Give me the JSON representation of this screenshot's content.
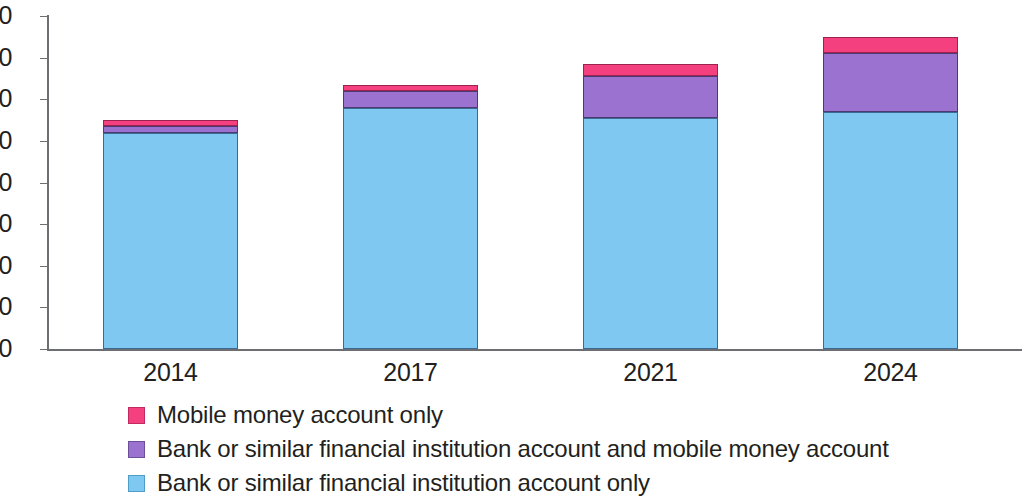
{
  "chart_data": {
    "type": "bar",
    "stacked": true,
    "title": "",
    "subtitle": "",
    "xlabel": "",
    "ylabel": "",
    "categories": [
      "2014",
      "2017",
      "2021",
      "2024"
    ],
    "ylim": [
      0,
      80
    ],
    "yticks": [
      0,
      10,
      20,
      30,
      40,
      50,
      60,
      70,
      80
    ],
    "ytick_labels": [
      "0",
      "10",
      "20",
      "30",
      "40",
      "50",
      "60",
      "70",
      "80"
    ],
    "grid": false,
    "legend_position": "bottom-left",
    "series": [
      {
        "name": "Bank or similar financial institution account only",
        "color": "#7ec8f2",
        "values": [
          52,
          58,
          55.5,
          57
        ]
      },
      {
        "name": "Bank or similar financial institution account and mobile money account",
        "color": "#9b72cf",
        "values": [
          1.5,
          4,
          10,
          14
        ]
      },
      {
        "name": "Mobile money account only",
        "color": "#f5407f",
        "values": [
          1.5,
          1.5,
          3,
          4
        ]
      }
    ],
    "totals": [
      55,
      63.5,
      68.5,
      75
    ]
  },
  "axis": {
    "y_ticks": [
      {
        "label": "80",
        "value": 80
      },
      {
        "label": "70",
        "value": 70
      },
      {
        "label": "60",
        "value": 60
      },
      {
        "label": "50",
        "value": 50
      },
      {
        "label": "40",
        "value": 40
      },
      {
        "label": "30",
        "value": 30
      },
      {
        "label": "20",
        "value": 20
      },
      {
        "label": "10",
        "value": 10
      },
      {
        "label": "0",
        "value": 0
      }
    ],
    "x_labels": [
      "2014",
      "2017",
      "2021",
      "2024"
    ]
  },
  "legend": {
    "items": [
      {
        "label": "Mobile money account only",
        "color": "#f5407f"
      },
      {
        "label": "Bank or similar financial institution account and mobile money account",
        "color": "#9b72cf"
      },
      {
        "label": "Bank or similar financial institution account only",
        "color": "#7ec8f2"
      }
    ]
  }
}
